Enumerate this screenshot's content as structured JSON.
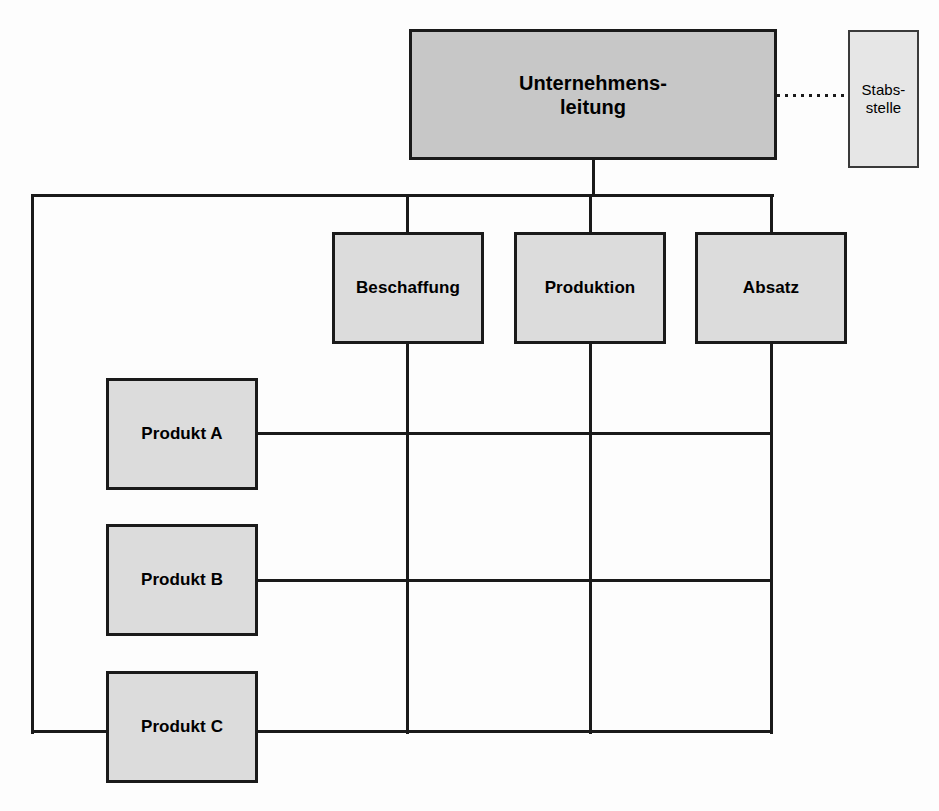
{
  "diagram": {
    "colors": {
      "background": "#fdfdfd",
      "line": "#1a1a1a",
      "exec_fill": "#c7c7c7",
      "unit_fill": "#dcdcdc",
      "staff_fill": "#e6e6e6",
      "text": "#000000"
    }
  },
  "nodes": {
    "executive": {
      "label": "Unternehmens-\nleitung",
      "role": "top-management",
      "x": 409,
      "y": 29,
      "w": 368,
      "h": 131
    },
    "staff": {
      "label": "Stabs-\nstelle",
      "role": "staff-unit",
      "x": 848,
      "y": 30,
      "w": 71,
      "h": 138
    },
    "functions": [
      {
        "label": "Beschaffung",
        "x": 332,
        "y": 232,
        "w": 152,
        "h": 112
      },
      {
        "label": "Produktion",
        "x": 514,
        "y": 232,
        "w": 152,
        "h": 112
      },
      {
        "label": "Absatz",
        "x": 695,
        "y": 232,
        "w": 152,
        "h": 112
      }
    ],
    "divisions": [
      {
        "label": "Produkt A",
        "x": 106,
        "y": 378,
        "w": 152,
        "h": 112
      },
      {
        "label": "Produkt B",
        "x": 106,
        "y": 524,
        "w": 152,
        "h": 112
      },
      {
        "label": "Produkt C",
        "x": 106,
        "y": 671,
        "w": 152,
        "h": 112
      }
    ]
  },
  "connectors": {
    "exec_drop": {
      "x": 592,
      "y": 159,
      "len": 36,
      "orient": "vertical"
    },
    "distribution_bar": {
      "x": 31,
      "y": 194,
      "len": 743,
      "orient": "horizontal"
    },
    "left_spine": {
      "x": 31,
      "y": 194,
      "len": 540,
      "orient": "vertical"
    },
    "staff_dotted": {
      "x": 777,
      "y": 94,
      "len": 71,
      "orient": "horizontal",
      "style": "dotted"
    },
    "function_stubs": [
      {
        "x": 406,
        "y": 194,
        "len": 39
      },
      {
        "x": 589,
        "y": 194,
        "len": 39
      },
      {
        "x": 770,
        "y": 194,
        "len": 39
      }
    ],
    "function_verticals": [
      {
        "x": 406,
        "y": 344,
        "len": 390
      },
      {
        "x": 589,
        "y": 344,
        "len": 390
      },
      {
        "x": 770,
        "y": 344,
        "len": 390
      }
    ],
    "division_rails": [
      {
        "x": 258,
        "y": 432,
        "len": 515
      },
      {
        "x": 258,
        "y": 579,
        "len": 515
      },
      {
        "x": 31,
        "y": 730,
        "len": 742
      }
    ]
  }
}
